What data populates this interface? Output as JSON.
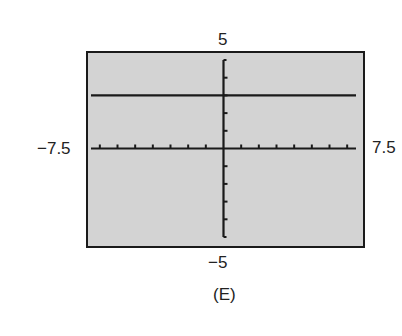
{
  "chart_data": {
    "type": "line",
    "title": "",
    "panel_label": "(E)",
    "xlabel": "",
    "ylabel": "",
    "xlim": [
      -7.5,
      7.5
    ],
    "ylim": [
      -5,
      5
    ],
    "xscale": 1,
    "yscale": 1,
    "grid": false,
    "window_labels": {
      "xmin": "−7.5",
      "xmax": "7.5",
      "ymin": "−5",
      "ymax": "5"
    },
    "series": [
      {
        "name": "y = 3",
        "equation": "y = 3",
        "x": [
          -7.5,
          7.5
        ],
        "y": [
          3,
          3
        ]
      }
    ],
    "colors": {
      "screen_background": "#d3d3d3",
      "line": "#1a1a1a",
      "axes": "#1a1a1a"
    }
  }
}
